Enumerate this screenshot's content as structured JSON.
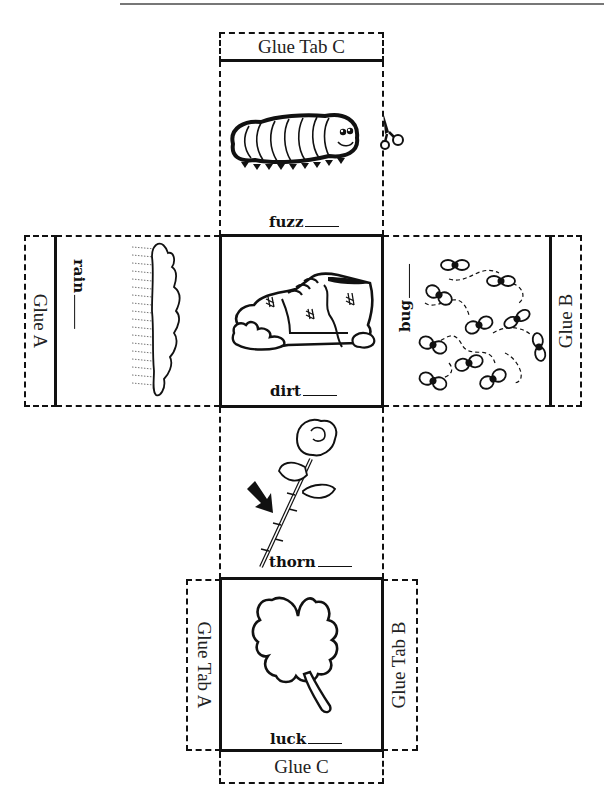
{
  "glue_tabs": {
    "top": "Glue Tab C",
    "left_side": "Glue A",
    "right_side": "Glue B",
    "bottom_left": "Glue Tab A",
    "bottom_right": "Glue Tab B",
    "bottom": "Glue C"
  },
  "faces": [
    {
      "id": "top",
      "word": "fuzz",
      "picture": "caterpillar-icon"
    },
    {
      "id": "left",
      "word": "rain",
      "picture": "rain-cloud-icon"
    },
    {
      "id": "center",
      "word": "dirt",
      "picture": "dirty-shoe-icon"
    },
    {
      "id": "right",
      "word": "bug",
      "picture": "flying-bugs-icon"
    },
    {
      "id": "lower",
      "word": "thorn",
      "picture": "rose-with-arrow-icon"
    },
    {
      "id": "bottom",
      "word": "luck",
      "picture": "shamrock-icon"
    }
  ],
  "icons": {
    "scissors": "scissors-icon"
  },
  "colors": {
    "ink": "#111111",
    "paper": "#ffffff",
    "rule": "#777777"
  }
}
